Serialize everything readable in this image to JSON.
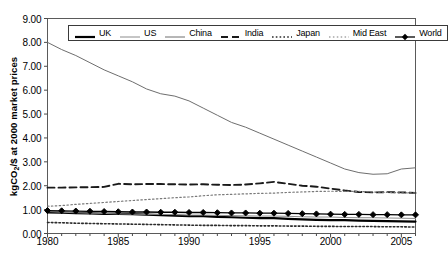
{
  "chart_data": {
    "type": "line",
    "title": "",
    "xlabel": "",
    "ylabel": "kgCO2/$ at 2000 market prices",
    "ylabel_html": "kgCO<sub>2</sub>/$ at 2000 market prices",
    "xlim": [
      1980,
      2006
    ],
    "ylim": [
      0.0,
      9.0
    ],
    "ytick_labels": [
      "0.00",
      "1.00",
      "2.00",
      "3.00",
      "4.00",
      "5.00",
      "6.00",
      "7.00",
      "8.00",
      "9.00"
    ],
    "ytick_values": [
      0,
      1,
      2,
      3,
      4,
      5,
      6,
      7,
      8,
      9
    ],
    "xtick_labels": [
      "1980",
      "1985",
      "1990",
      "1995",
      "2000",
      "2005"
    ],
    "xtick_values": [
      1980,
      1985,
      1990,
      1995,
      2000,
      2005
    ],
    "grid": false,
    "legend_position": "top-inside",
    "x": [
      1980,
      1981,
      1982,
      1983,
      1984,
      1985,
      1986,
      1987,
      1988,
      1989,
      1990,
      1991,
      1992,
      1993,
      1994,
      1995,
      1996,
      1997,
      1998,
      1999,
      2000,
      2001,
      2002,
      2003,
      2004,
      2005,
      2006
    ],
    "series": [
      {
        "name": "UK",
        "style": "solid-thick",
        "color": "#000000",
        "values": [
          0.88,
          0.87,
          0.85,
          0.84,
          0.82,
          0.82,
          0.81,
          0.79,
          0.77,
          0.75,
          0.73,
          0.73,
          0.7,
          0.68,
          0.66,
          0.64,
          0.64,
          0.61,
          0.59,
          0.57,
          0.56,
          0.56,
          0.54,
          0.53,
          0.52,
          0.51,
          0.5
        ]
      },
      {
        "name": "US",
        "style": "solid-thin",
        "color": "#8c8c8c",
        "values": [
          0.92,
          0.89,
          0.87,
          0.85,
          0.84,
          0.82,
          0.81,
          0.8,
          0.8,
          0.79,
          0.77,
          0.77,
          0.76,
          0.75,
          0.74,
          0.73,
          0.73,
          0.72,
          0.7,
          0.69,
          0.69,
          0.67,
          0.66,
          0.66,
          0.65,
          0.64,
          0.63
        ]
      },
      {
        "name": "China",
        "style": "solid-thin",
        "color": "#6e6e6e",
        "values": [
          8.0,
          7.7,
          7.45,
          7.15,
          6.85,
          6.6,
          6.35,
          6.05,
          5.85,
          5.75,
          5.55,
          5.25,
          4.95,
          4.65,
          4.45,
          4.2,
          3.95,
          3.7,
          3.45,
          3.2,
          2.95,
          2.7,
          2.55,
          2.48,
          2.5,
          2.7,
          2.75
        ]
      },
      {
        "name": "India",
        "style": "dashed",
        "color": "#1a1a1a",
        "values": [
          1.92,
          1.92,
          1.93,
          1.94,
          1.95,
          2.08,
          2.06,
          2.07,
          2.07,
          2.06,
          2.05,
          2.06,
          2.04,
          2.03,
          2.05,
          2.1,
          2.16,
          2.08,
          2.0,
          1.96,
          1.88,
          1.8,
          1.74,
          1.72,
          1.73,
          1.72,
          1.7
        ]
      },
      {
        "name": "Japan",
        "style": "dotted",
        "color": "#2b2b2b",
        "values": [
          0.46,
          0.45,
          0.43,
          0.42,
          0.41,
          0.4,
          0.39,
          0.38,
          0.37,
          0.36,
          0.35,
          0.34,
          0.34,
          0.33,
          0.33,
          0.32,
          0.32,
          0.31,
          0.31,
          0.3,
          0.3,
          0.29,
          0.29,
          0.29,
          0.28,
          0.28,
          0.27
        ]
      },
      {
        "name": "Mid East",
        "style": "fine-dotted",
        "color": "#7a7a7a",
        "values": [
          1.14,
          1.17,
          1.22,
          1.26,
          1.3,
          1.34,
          1.38,
          1.42,
          1.46,
          1.5,
          1.53,
          1.58,
          1.62,
          1.64,
          1.66,
          1.68,
          1.69,
          1.72,
          1.74,
          1.76,
          1.77,
          1.76,
          1.76,
          1.74,
          1.72,
          1.7,
          1.7
        ]
      },
      {
        "name": "World",
        "style": "marked",
        "color": "#000000",
        "marker": "diamond",
        "values": [
          0.96,
          0.95,
          0.94,
          0.93,
          0.92,
          0.91,
          0.9,
          0.9,
          0.89,
          0.89,
          0.88,
          0.88,
          0.87,
          0.86,
          0.86,
          0.85,
          0.85,
          0.84,
          0.83,
          0.82,
          0.81,
          0.8,
          0.8,
          0.79,
          0.79,
          0.78,
          0.78
        ]
      }
    ],
    "legend_entries": [
      {
        "label": "UK",
        "style": "solid-thick"
      },
      {
        "label": "US",
        "style": "solid-thin"
      },
      {
        "label": "China",
        "style": "solid-thin"
      },
      {
        "label": "India",
        "style": "dashed"
      },
      {
        "label": "Japan",
        "style": "dotted"
      },
      {
        "label": "Mid East",
        "style": "fine-dotted"
      },
      {
        "label": "World",
        "style": "marked"
      }
    ]
  }
}
